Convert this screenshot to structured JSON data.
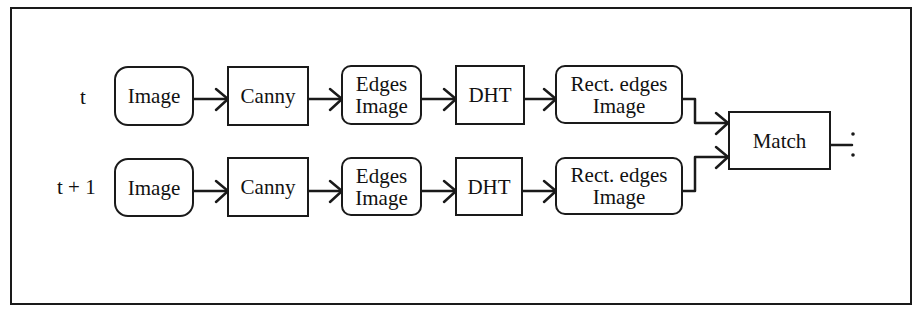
{
  "diagram": {
    "type": "flowchart",
    "rows": [
      {
        "label": "t",
        "nodes": [
          {
            "id": "image",
            "text": "Image",
            "shape": "rounded"
          },
          {
            "id": "canny",
            "text": "Canny",
            "shape": "rect"
          },
          {
            "id": "edges_image",
            "text": "Edges\nImage",
            "shape": "rounded"
          },
          {
            "id": "dht",
            "text": "DHT",
            "shape": "rect"
          },
          {
            "id": "rect_edges_image",
            "text": "Rect. edges\nImage",
            "shape": "rounded"
          }
        ]
      },
      {
        "label": "t + 1",
        "nodes": [
          {
            "id": "image",
            "text": "Image",
            "shape": "rounded"
          },
          {
            "id": "canny",
            "text": "Canny",
            "shape": "rect"
          },
          {
            "id": "edges_image",
            "text": "Edges\nImage",
            "shape": "rounded"
          },
          {
            "id": "dht",
            "text": "DHT",
            "shape": "rect"
          },
          {
            "id": "rect_edges_image",
            "text": "Rect. edges\nImage",
            "shape": "rounded"
          }
        ]
      }
    ],
    "merge_node": {
      "id": "match",
      "text": "Match",
      "shape": "rect"
    },
    "edges": [
      [
        "row0.image",
        "row0.canny"
      ],
      [
        "row0.canny",
        "row0.edges_image"
      ],
      [
        "row0.edges_image",
        "row0.dht"
      ],
      [
        "row0.dht",
        "row0.rect_edges_image"
      ],
      [
        "row0.rect_edges_image",
        "match"
      ],
      [
        "row1.image",
        "row1.canny"
      ],
      [
        "row1.canny",
        "row1.edges_image"
      ],
      [
        "row1.edges_image",
        "row1.dht"
      ],
      [
        "row1.dht",
        "row1.rect_edges_image"
      ],
      [
        "row1.rect_edges_image",
        "match"
      ]
    ],
    "continuation_mark": ":",
    "colors": {
      "stroke": "#1a1a1a",
      "background": "#ffffff",
      "text": "#111111"
    }
  }
}
